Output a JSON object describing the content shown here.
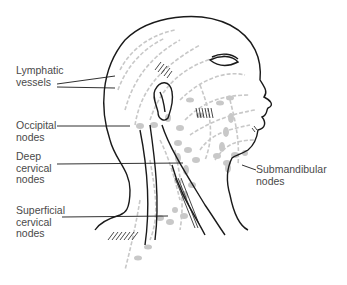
{
  "diagram": {
    "labels": {
      "lymphatic_vessels": "Lymphatic\nvessels",
      "occipital_nodes": "Occipital\nnodes",
      "deep_cervical_nodes": "Deep\ncervical\nnodes",
      "superficial_cervical_nodes": "Superficial\ncervical\nnodes",
      "submandibular_nodes": "Submandibular\nnodes"
    },
    "colors": {
      "outline": "#1a1a1a",
      "lymph": "#c8c8c8",
      "text": "#4a4a4a"
    }
  }
}
